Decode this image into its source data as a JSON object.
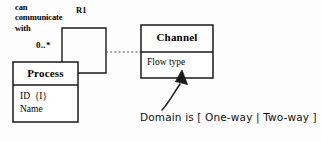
{
  "diagram": {
    "type": "uml-class-diagram",
    "background_color": "#fdfdfd",
    "line_color": "#1a1a1a",
    "text_color": "#000000",
    "association": {
      "verb_phrase": "can\ncommunicate\nwith",
      "relationship_id": "R1",
      "multiplicity": "0..*",
      "loop_style": "reflexive-rectangle"
    },
    "classes": [
      {
        "name": "process-class",
        "title": "Process",
        "attributes": "ID  {I}\nName"
      },
      {
        "name": "channel-class",
        "title": "Channel",
        "attributes": "Flow type"
      }
    ],
    "connector": {
      "name": "association-class-link",
      "style": "dashed"
    },
    "annotation": {
      "text": "Domain is [ One-way | Two-way ]",
      "pointer": "curved-arrow"
    }
  }
}
